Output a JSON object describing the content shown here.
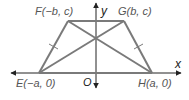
{
  "diagram": {
    "type": "coordinate-geometry",
    "axes": {
      "x_label": "x",
      "y_label": "y",
      "origin_label": "O"
    },
    "points": [
      {
        "name": "E",
        "label": "E(−a, 0)",
        "x": 39,
        "y": 73
      },
      {
        "name": "F",
        "label": "F(−b, c)",
        "x": 68,
        "y": 21
      },
      {
        "name": "G",
        "label": "G(b, c)",
        "x": 124,
        "y": 21
      },
      {
        "name": "H",
        "label": "H(a, 0)",
        "x": 152,
        "y": 73
      }
    ],
    "segments": [
      "EF",
      "FG",
      "GH",
      "HE",
      "EG",
      "FH"
    ],
    "congruence_marks": [
      "EF",
      "GH"
    ],
    "colors": {
      "shape_stroke": "#7a7a7a",
      "axis_stroke": "#222222",
      "label_text": "#555555"
    }
  }
}
